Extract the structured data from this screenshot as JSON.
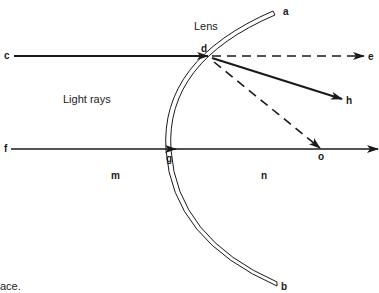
{
  "diagram": {
    "title": "Lens",
    "region_label": "Light rays",
    "caption_fragment": "ace.",
    "points": {
      "a": "a",
      "b": "b",
      "c": "c",
      "d": "d",
      "e": "e",
      "f": "f",
      "g": "g",
      "h": "h",
      "m": "m",
      "n": "n",
      "o": "o"
    },
    "rays": [
      {
        "name": "incident-ray-upper",
        "from": "c",
        "to": "d",
        "style": "solid"
      },
      {
        "name": "unrefracted-path-upper",
        "from": "d",
        "to": "e",
        "style": "dashed"
      },
      {
        "name": "refracted-ray",
        "from": "d",
        "to": "h",
        "style": "solid"
      },
      {
        "name": "focal-ray",
        "from": "d",
        "to": "o",
        "style": "dashed"
      },
      {
        "name": "principal-axis-ray",
        "from": "f",
        "to": "end",
        "style": "solid",
        "through": [
          "g",
          "o"
        ]
      }
    ],
    "colors": {
      "ink": "#1a1a1a",
      "background": "#ffffff"
    }
  }
}
